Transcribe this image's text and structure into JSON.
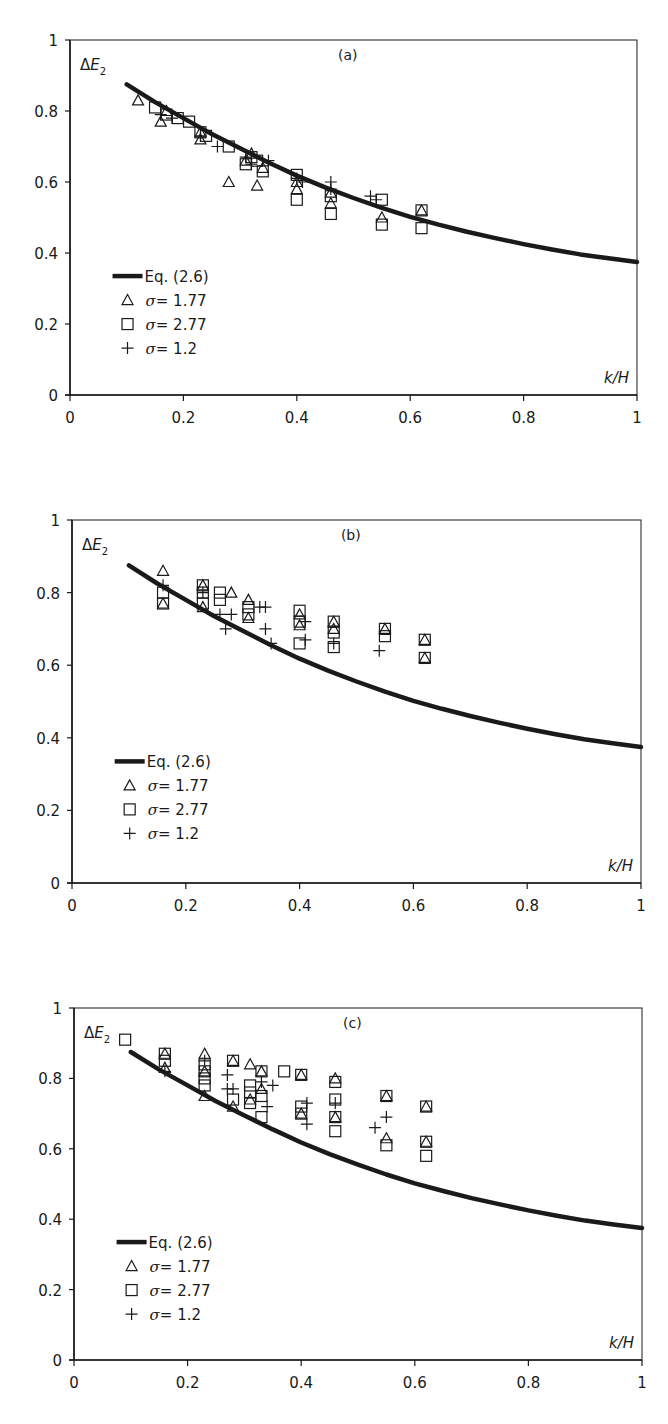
{
  "chart_data": [
    {
      "type": "scatter",
      "panel_label": "(a)",
      "ylabel": "ΔE₂",
      "xlabel": "k/H",
      "xlim": [
        0,
        1
      ],
      "ylim": [
        0,
        1
      ],
      "x_ticks": [
        "0",
        "0.2",
        "0.4",
        "0.6",
        "0.8",
        "1"
      ],
      "y_ticks": [
        "0",
        "0.2",
        "0.4",
        "0.6",
        "0.8",
        "1"
      ],
      "grid": false,
      "legend_position": "lower-left",
      "legend": [
        "Eq. (2.6)",
        "σ = 1.77",
        "σ = 2.77",
        "σ = 1.2"
      ],
      "curve": {
        "name": "Eq. (2.6)",
        "x": [
          0.1,
          0.15,
          0.2,
          0.25,
          0.3,
          0.35,
          0.4,
          0.45,
          0.5,
          0.55,
          0.6,
          0.65,
          0.7,
          0.75,
          0.8,
          0.85,
          0.9,
          0.95,
          1.0
        ],
        "y": [
          0.875,
          0.825,
          0.78,
          0.735,
          0.695,
          0.655,
          0.618,
          0.585,
          0.555,
          0.527,
          0.502,
          0.48,
          0.46,
          0.442,
          0.425,
          0.41,
          0.396,
          0.385,
          0.375
        ]
      },
      "series": [
        {
          "name": "σ = 1.77",
          "marker": "triangle",
          "x": [
            0.12,
            0.16,
            0.17,
            0.23,
            0.23,
            0.28,
            0.31,
            0.32,
            0.33,
            0.34,
            0.4,
            0.4,
            0.46,
            0.46,
            0.55,
            0.62
          ],
          "y": [
            0.83,
            0.77,
            0.8,
            0.72,
            0.74,
            0.6,
            0.66,
            0.68,
            0.59,
            0.64,
            0.58,
            0.6,
            0.54,
            0.57,
            0.5,
            0.52
          ]
        },
        {
          "name": "σ = 2.77",
          "marker": "square",
          "x": [
            0.15,
            0.17,
            0.19,
            0.21,
            0.23,
            0.24,
            0.28,
            0.31,
            0.32,
            0.33,
            0.34,
            0.4,
            0.4,
            0.46,
            0.46,
            0.55,
            0.55,
            0.62,
            0.62
          ],
          "y": [
            0.81,
            0.79,
            0.78,
            0.77,
            0.74,
            0.73,
            0.7,
            0.65,
            0.67,
            0.66,
            0.63,
            0.62,
            0.55,
            0.56,
            0.51,
            0.55,
            0.48,
            0.52,
            0.47
          ]
        },
        {
          "name": "σ = 1.2",
          "marker": "plus",
          "x": [
            0.16,
            0.18,
            0.23,
            0.26,
            0.31,
            0.32,
            0.35,
            0.4,
            0.41,
            0.46,
            0.46,
            0.53,
            0.54
          ],
          "y": [
            0.79,
            0.78,
            0.73,
            0.7,
            0.67,
            0.65,
            0.66,
            0.61,
            0.6,
            0.6,
            0.58,
            0.56,
            0.55
          ]
        }
      ]
    },
    {
      "type": "scatter",
      "panel_label": "(b)",
      "ylabel": "ΔE₂",
      "xlabel": "k/H",
      "xlim": [
        0,
        1
      ],
      "ylim": [
        0,
        1
      ],
      "x_ticks": [
        "0",
        "0.2",
        "0.4",
        "0.6",
        "0.8",
        "1"
      ],
      "y_ticks": [
        "0",
        "0.2",
        "0.4",
        "0.6",
        "0.8",
        "1"
      ],
      "grid": false,
      "legend_position": "lower-left",
      "legend": [
        "Eq. (2.6)",
        "σ = 1.77",
        "σ = 2.77",
        "σ = 1.2"
      ],
      "curve": {
        "name": "Eq. (2.6)",
        "x": [
          0.1,
          0.15,
          0.2,
          0.25,
          0.3,
          0.35,
          0.4,
          0.45,
          0.5,
          0.55,
          0.6,
          0.65,
          0.7,
          0.75,
          0.8,
          0.85,
          0.9,
          0.95,
          1.0
        ],
        "y": [
          0.875,
          0.825,
          0.78,
          0.735,
          0.695,
          0.655,
          0.618,
          0.585,
          0.555,
          0.527,
          0.502,
          0.48,
          0.46,
          0.442,
          0.425,
          0.41,
          0.396,
          0.385,
          0.375
        ]
      },
      "series": [
        {
          "name": "σ = 1.77",
          "marker": "triangle",
          "x": [
            0.16,
            0.16,
            0.23,
            0.23,
            0.28,
            0.31,
            0.31,
            0.4,
            0.4,
            0.46,
            0.46,
            0.55,
            0.62,
            0.62
          ],
          "y": [
            0.86,
            0.77,
            0.82,
            0.76,
            0.8,
            0.78,
            0.73,
            0.74,
            0.71,
            0.72,
            0.7,
            0.7,
            0.67,
            0.62
          ]
        },
        {
          "name": "σ = 2.77",
          "marker": "square",
          "x": [
            0.16,
            0.16,
            0.23,
            0.23,
            0.23,
            0.26,
            0.26,
            0.31,
            0.31,
            0.4,
            0.4,
            0.4,
            0.46,
            0.46,
            0.46,
            0.55,
            0.55,
            0.62,
            0.62
          ],
          "y": [
            0.8,
            0.77,
            0.82,
            0.8,
            0.77,
            0.8,
            0.78,
            0.76,
            0.74,
            0.75,
            0.72,
            0.66,
            0.72,
            0.69,
            0.65,
            0.7,
            0.68,
            0.67,
            0.62
          ]
        },
        {
          "name": "σ = 1.2",
          "marker": "plus",
          "x": [
            0.16,
            0.23,
            0.26,
            0.27,
            0.28,
            0.33,
            0.34,
            0.34,
            0.35,
            0.41,
            0.41,
            0.46,
            0.54
          ],
          "y": [
            0.82,
            0.8,
            0.74,
            0.7,
            0.74,
            0.76,
            0.76,
            0.7,
            0.66,
            0.72,
            0.67,
            0.66,
            0.64
          ]
        }
      ]
    },
    {
      "type": "scatter",
      "panel_label": "(c)",
      "ylabel": "ΔE₂",
      "xlabel": "k/H",
      "xlim": [
        0,
        1
      ],
      "ylim": [
        0,
        1
      ],
      "x_ticks": [
        "0",
        "0.2",
        "0.4",
        "0.6",
        "0.8",
        "1"
      ],
      "y_ticks": [
        "0",
        "0.2",
        "0.4",
        "0.6",
        "0.8",
        "1"
      ],
      "grid": false,
      "legend_position": "lower-left",
      "legend": [
        "Eq. (2.6)",
        "σ = 1.77",
        "σ = 2.77",
        "σ = 1.2"
      ],
      "curve": {
        "name": "Eq. (2.6)",
        "x": [
          0.1,
          0.15,
          0.2,
          0.25,
          0.3,
          0.35,
          0.4,
          0.45,
          0.5,
          0.55,
          0.6,
          0.65,
          0.7,
          0.75,
          0.8,
          0.85,
          0.9,
          0.95,
          1.0
        ],
        "y": [
          0.875,
          0.825,
          0.78,
          0.735,
          0.695,
          0.655,
          0.618,
          0.585,
          0.555,
          0.527,
          0.502,
          0.48,
          0.46,
          0.442,
          0.425,
          0.41,
          0.396,
          0.385,
          0.375
        ]
      },
      "series": [
        {
          "name": "σ = 1.77",
          "marker": "triangle",
          "x": [
            0.16,
            0.16,
            0.23,
            0.23,
            0.23,
            0.28,
            0.28,
            0.31,
            0.31,
            0.33,
            0.33,
            0.4,
            0.4,
            0.46,
            0.46,
            0.55,
            0.55,
            0.62,
            0.62
          ],
          "y": [
            0.87,
            0.83,
            0.87,
            0.82,
            0.75,
            0.85,
            0.72,
            0.84,
            0.74,
            0.82,
            0.77,
            0.81,
            0.7,
            0.8,
            0.69,
            0.75,
            0.63,
            0.72,
            0.62
          ]
        },
        {
          "name": "σ = 2.77",
          "marker": "square",
          "x": [
            0.09,
            0.16,
            0.16,
            0.23,
            0.23,
            0.23,
            0.23,
            0.28,
            0.28,
            0.31,
            0.31,
            0.31,
            0.33,
            0.33,
            0.33,
            0.37,
            0.4,
            0.4,
            0.4,
            0.46,
            0.46,
            0.46,
            0.46,
            0.55,
            0.55,
            0.62,
            0.62,
            0.62
          ],
          "y": [
            0.91,
            0.87,
            0.85,
            0.84,
            0.82,
            0.8,
            0.78,
            0.85,
            0.74,
            0.78,
            0.76,
            0.73,
            0.82,
            0.75,
            0.69,
            0.82,
            0.81,
            0.72,
            0.7,
            0.79,
            0.74,
            0.69,
            0.65,
            0.75,
            0.61,
            0.72,
            0.62,
            0.58
          ]
        },
        {
          "name": "σ = 1.2",
          "marker": "plus",
          "x": [
            0.16,
            0.23,
            0.27,
            0.27,
            0.28,
            0.33,
            0.34,
            0.35,
            0.41,
            0.41,
            0.46,
            0.53,
            0.55
          ],
          "y": [
            0.82,
            0.85,
            0.81,
            0.77,
            0.77,
            0.79,
            0.72,
            0.78,
            0.73,
            0.67,
            0.73,
            0.66,
            0.69
          ]
        }
      ]
    }
  ],
  "panels": [
    {
      "label": "(a)",
      "ylabel_main": "ΔE",
      "ylabel_sub": "2",
      "xlabel": "k/H"
    },
    {
      "label": "(b)",
      "ylabel_main": "ΔE",
      "ylabel_sub": "2",
      "xlabel": "k/H"
    },
    {
      "label": "(c)",
      "ylabel_main": "ΔE",
      "ylabel_sub": "2",
      "xlabel": "k/H"
    }
  ],
  "legend": {
    "curve_label": "Eq. (2.6)",
    "items": [
      {
        "symbol": "σ",
        "text": "= 1.77",
        "marker": "triangle"
      },
      {
        "symbol": "σ",
        "text": "= 2.77",
        "marker": "square"
      },
      {
        "symbol": "σ",
        "text": "= 1.2",
        "marker": "plus"
      }
    ]
  },
  "ticks": {
    "x": [
      "0",
      "0.2",
      "0.4",
      "0.6",
      "0.8",
      "1"
    ],
    "y": [
      "0",
      "0.2",
      "0.4",
      "0.6",
      "0.8",
      "1"
    ]
  },
  "colors": {
    "ink": "#1a1a1a",
    "background": "#ffffff"
  }
}
